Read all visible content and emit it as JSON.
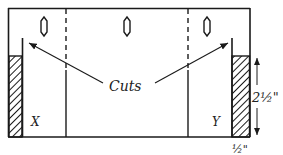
{
  "diagram": {
    "labels": {
      "cuts": "Cuts",
      "left_flap": "X",
      "right_flap": "Y",
      "height_dim": "2½\"",
      "width_dim": "½\""
    },
    "slots": 3,
    "colors": {
      "stroke": "#1a1a1a",
      "hatch": "#1a1a1a",
      "background": "#ffffff"
    }
  }
}
